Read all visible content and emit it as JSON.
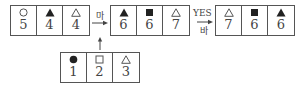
{
  "boxes": {
    "a": {
      "cells": [
        {
          "symbol": "hollow-circle",
          "value": "5"
        },
        {
          "symbol": "filled-triangle",
          "value": "4"
        },
        {
          "symbol": "hollow-triangle",
          "value": "4"
        }
      ]
    },
    "b": {
      "cells": [
        {
          "symbol": "filled-triangle",
          "value": "6"
        },
        {
          "symbol": "filled-square",
          "value": "6"
        },
        {
          "symbol": "hollow-triangle",
          "value": "7"
        }
      ]
    },
    "c": {
      "cells": [
        {
          "symbol": "hollow-triangle",
          "value": "7"
        },
        {
          "symbol": "filled-square",
          "value": "6"
        },
        {
          "symbol": "filled-triangle",
          "value": "6"
        }
      ]
    },
    "d": {
      "cells": [
        {
          "symbol": "filled-circle",
          "value": "1"
        },
        {
          "symbol": "hollow-square",
          "value": "2"
        },
        {
          "symbol": "hollow-triangle",
          "value": "3"
        }
      ]
    }
  },
  "arrows": {
    "first": {
      "label": "마"
    },
    "second": {
      "condition": "YES",
      "label": "바"
    }
  },
  "colors": {
    "stroke": "#555555",
    "fill": "#222222",
    "text": "#444444"
  }
}
